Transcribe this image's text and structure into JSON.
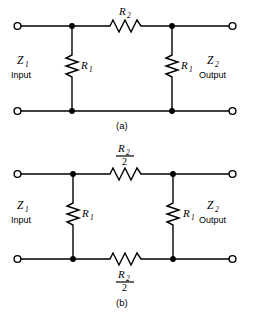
{
  "figure": {
    "ink_color": "#000000",
    "background_color": "#ffffff"
  },
  "panels": [
    {
      "id": "a",
      "caption": "(a)",
      "topology": "tee-network-single-series-resistor",
      "left_port": {
        "impedance_symbol": "Z",
        "impedance_subscript": "1",
        "role_label": "Input"
      },
      "right_port": {
        "impedance_symbol": "Z",
        "impedance_subscript": "2",
        "role_label": "Output"
      },
      "series_elements": [
        {
          "name": "series-resistor-top",
          "symbol": "R",
          "subscript": "2",
          "label_kind": "plain",
          "position": "top-rail-center"
        }
      ],
      "shunt_elements": [
        {
          "name": "shunt-resistor-left",
          "symbol": "R",
          "subscript": "1",
          "label_kind": "plain",
          "position": "left-branch"
        },
        {
          "name": "shunt-resistor-right",
          "symbol": "R",
          "subscript": "1",
          "label_kind": "plain",
          "position": "right-branch"
        }
      ]
    },
    {
      "id": "b",
      "caption": "(b)",
      "topology": "balanced-network-split-series-resistors",
      "left_port": {
        "impedance_symbol": "Z",
        "impedance_subscript": "1",
        "role_label": "Input"
      },
      "right_port": {
        "impedance_symbol": "Z",
        "impedance_subscript": "2",
        "role_label": "Output"
      },
      "series_elements": [
        {
          "name": "series-resistor-top",
          "symbol": "R",
          "subscript": "2",
          "label_kind": "fraction",
          "denominator": "2",
          "position": "top-rail-center"
        },
        {
          "name": "series-resistor-bottom",
          "symbol": "R",
          "subscript": "2",
          "label_kind": "fraction",
          "denominator": "2",
          "position": "bottom-rail-center"
        }
      ],
      "shunt_elements": [
        {
          "name": "shunt-resistor-left",
          "symbol": "R",
          "subscript": "1",
          "label_kind": "plain",
          "position": "left-branch"
        },
        {
          "name": "shunt-resistor-right",
          "symbol": "R",
          "subscript": "1",
          "label_kind": "plain",
          "position": "right-branch"
        }
      ]
    }
  ]
}
